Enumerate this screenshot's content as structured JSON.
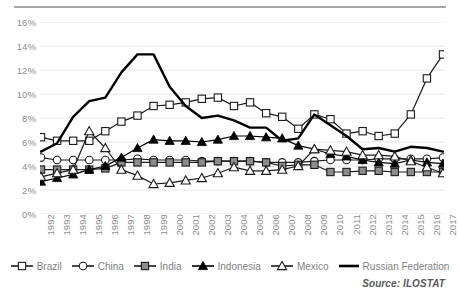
{
  "chart_data": {
    "type": "line",
    "title": "",
    "xlabel": "",
    "ylabel": "",
    "ylim": [
      0,
      16
    ],
    "ytick_step": 2,
    "ytick_labels": [
      "0%",
      "2%",
      "4%",
      "6%",
      "8%",
      "10%",
      "12%",
      "14%",
      "16%"
    ],
    "grid": "horizontal",
    "legend_position": "bottom",
    "x": [
      1992,
      1993,
      1994,
      1995,
      1996,
      1997,
      1998,
      1999,
      2000,
      2001,
      2002,
      2003,
      2004,
      2005,
      2006,
      2007,
      2008,
      2009,
      2010,
      2011,
      2012,
      2013,
      2014,
      2015,
      2016,
      2017
    ],
    "categories": [
      "1992",
      "1993",
      "1994",
      "1995",
      "1996",
      "1997",
      "1998",
      "1999",
      "2000",
      "2001",
      "2002",
      "2003",
      "2004",
      "2005",
      "2006",
      "2007",
      "2008",
      "2009",
      "2010",
      "2011",
      "2012",
      "2013",
      "2014",
      "2015",
      "2016",
      "2017"
    ],
    "series": [
      {
        "name": "Brazil",
        "marker": "square-open",
        "color": "#1a1a1a",
        "values": [
          6.4,
          6.1,
          6.1,
          6.1,
          6.9,
          7.7,
          8.2,
          9.0,
          9.1,
          9.3,
          9.6,
          9.7,
          9.0,
          9.3,
          8.4,
          8.1,
          7.1,
          8.3,
          7.9,
          6.7,
          6.9,
          6.5,
          6.7,
          8.3,
          11.3,
          13.3
        ]
      },
      {
        "name": "China",
        "marker": "circle-open",
        "color": "#1a1a1a",
        "values": [
          4.7,
          4.5,
          4.5,
          4.5,
          4.5,
          4.5,
          4.6,
          4.5,
          4.5,
          4.5,
          4.4,
          4.4,
          4.4,
          4.4,
          4.3,
          4.3,
          4.3,
          4.4,
          4.5,
          4.5,
          4.5,
          4.6,
          4.6,
          4.6,
          4.6,
          4.7
        ]
      },
      {
        "name": "India",
        "marker": "square-filled",
        "color": "#1a1a1a",
        "values": [
          3.7,
          3.7,
          3.7,
          3.7,
          3.8,
          4.3,
          4.3,
          4.3,
          4.3,
          4.3,
          4.3,
          4.4,
          4.4,
          4.4,
          4.3,
          4.0,
          4.1,
          4.1,
          3.5,
          3.5,
          3.6,
          3.6,
          3.5,
          3.5,
          3.5,
          3.5
        ]
      },
      {
        "name": "Indonesia",
        "marker": "triangle-filled",
        "color": "#000000",
        "values": [
          2.7,
          3.0,
          3.3,
          3.7,
          4.0,
          4.7,
          5.5,
          6.2,
          6.1,
          6.1,
          6.0,
          6.2,
          6.5,
          6.5,
          6.4,
          6.3,
          5.7,
          5.4,
          5.0,
          4.8,
          4.5,
          4.3,
          4.2,
          4.5,
          4.3,
          4.2
        ]
      },
      {
        "name": "Mexico",
        "marker": "triangle-open",
        "color": "#1a1a1a",
        "values": [
          3.1,
          3.4,
          3.7,
          6.9,
          5.5,
          3.7,
          3.2,
          2.5,
          2.6,
          2.8,
          3.0,
          3.4,
          3.9,
          3.6,
          3.6,
          3.7,
          4.0,
          5.4,
          5.3,
          5.2,
          4.9,
          4.9,
          4.8,
          4.4,
          3.9,
          3.4
        ]
      },
      {
        "name": "Russian Federation",
        "marker": "none",
        "color": "#000000",
        "values": [
          5.2,
          5.9,
          8.1,
          9.4,
          9.7,
          11.8,
          13.3,
          13.3,
          10.6,
          9.0,
          8.0,
          8.2,
          7.8,
          7.2,
          7.2,
          6.1,
          6.3,
          8.3,
          7.4,
          6.5,
          5.4,
          5.5,
          5.2,
          5.6,
          5.5,
          5.2
        ]
      }
    ]
  },
  "source": {
    "text": "Source: ILOSTAT"
  }
}
